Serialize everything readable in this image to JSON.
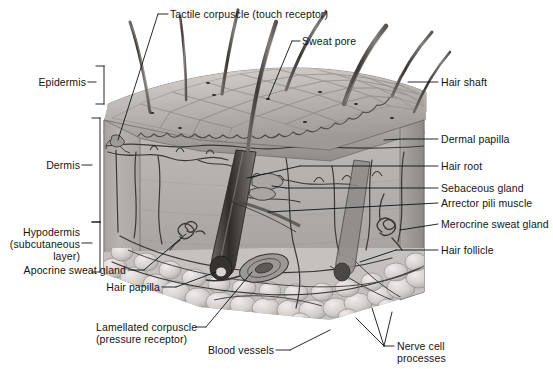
{
  "figure": {
    "kind": "anatomical-illustration",
    "style": "grayscale airbrush rendering with black leader lines and brackets",
    "background_color": "#ffffff",
    "line_color": "#111111",
    "text_color": "#141414"
  },
  "labels": {
    "tactile_corpuscle": "Tactile corpuscle (touch receptor)",
    "sweat_pore": "Sweat pore",
    "hair_shaft": "Hair shaft",
    "epidermis": "Epidermis",
    "dermis": "Dermis",
    "hypodermis_line1": "Hypodermis",
    "hypodermis_line2": "(subcutaneous",
    "hypodermis_line3": "layer)",
    "dermal_papilla": "Dermal papilla",
    "hair_root": "Hair root",
    "sebaceous_gland": "Sebaceous gland",
    "arrector_pili_muscle": "Arrector pili muscle",
    "merocrine_sweat_gland": "Merocrine sweat gland",
    "hair_follicle": "Hair follicle",
    "apocrine_sweat_gland": "Apocrine sweat gland",
    "hair_papilla": "Hair papilla",
    "lamellated_corpuscle_line1": "Lamellated corpuscle",
    "lamellated_corpuscle_line2": "(pressure receptor)",
    "blood_vessels": "Blood vessels",
    "nerve_cell_line1": "Nerve cell",
    "nerve_cell_line2": "processes"
  },
  "brackets": [
    {
      "name": "epidermis-bracket",
      "label": "Epidermis",
      "top": 66,
      "bottom": 104
    },
    {
      "name": "dermis-bracket",
      "label": "Dermis",
      "top": 118,
      "bottom": 222
    },
    {
      "name": "hypodermis-bracket",
      "label": "Hypodermis (subcutaneous layer)",
      "top": 222,
      "bottom": 272
    }
  ],
  "structures": [
    {
      "name": "hair-shaft",
      "count": 8,
      "description": "long tapered hairs emerging from epidermal surface"
    },
    {
      "name": "epidermis-layer",
      "description": "thin upper layer with polygonal surface cell pattern"
    },
    {
      "name": "dermis-layer",
      "description": "thick middle layer with vessels, nerves, glands, follicles"
    },
    {
      "name": "hypodermis-layer",
      "description": "lower fatty adipose lobules"
    },
    {
      "name": "hair-follicle",
      "description": "oblique tube enclosing hair root down to bulb"
    },
    {
      "name": "hair-papilla",
      "description": "small knob at base of hair bulb"
    },
    {
      "name": "sebaceous-gland",
      "description": "lobed gland attached to follicle"
    },
    {
      "name": "arrector-pili-muscle",
      "description": "slender muscle band from follicle to epidermis"
    },
    {
      "name": "merocrine-sweat-gland",
      "description": "coiled tubular gland in deep dermis"
    },
    {
      "name": "apocrine-sweat-gland",
      "description": "coiled gland near dermis-hypodermis border"
    },
    {
      "name": "lamellated-corpuscle",
      "description": "onion-shaped pressure receptor in deep dermis"
    },
    {
      "name": "tactile-corpuscle",
      "description": "small receptor in dermal papilla"
    },
    {
      "name": "blood-vessels",
      "description": "branching vessel network through dermis and hypodermis"
    },
    {
      "name": "nerve-cell-processes",
      "description": "nerve fibers in hypodermis"
    },
    {
      "name": "sweat-pore",
      "description": "tiny opening on skin surface"
    },
    {
      "name": "dermal-papilla",
      "description": "wavy ridges of dermis projecting into epidermis"
    }
  ]
}
